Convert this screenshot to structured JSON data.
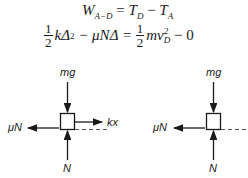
{
  "equations": {
    "line1": {
      "lhs": "W",
      "lhs_sub": "A−D",
      "eq": " = ",
      "t1": "T",
      "t1_sub": "D",
      "minus": " − ",
      "t2": "T",
      "t2_sub": "A"
    },
    "line2": {
      "frac_num": "1",
      "frac_den": "2",
      "term1": "kΔ",
      "term1_sup": "2",
      "term2": " − μNΔ = ",
      "frac2_num": "1",
      "frac2_den": "2",
      "term3": "mv",
      "term3_sup": "2",
      "term3_sub": "D",
      "term4": " − 0"
    }
  },
  "diagrams": [
    {
      "labels": {
        "top": "mg",
        "left": "μN",
        "right": "kx",
        "bottom": "N"
      }
    },
    {
      "labels": {
        "top": "mg",
        "left": "μN",
        "bottom": "N"
      }
    }
  ]
}
